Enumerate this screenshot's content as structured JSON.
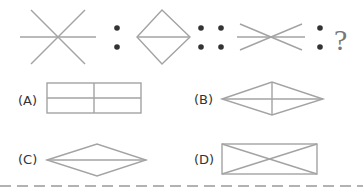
{
  "question": {
    "analogy": {
      "figure_1": "asterisk-three-lines",
      "separator_1": ":",
      "figure_2": "diamond-with-horizontal-line",
      "separator_2": "::",
      "figure_3": "flattened-asterisk-three-lines",
      "separator_3": ":",
      "unknown": "?"
    },
    "options": [
      {
        "label": "(A)",
        "figure": "rectangle-divided-into-four"
      },
      {
        "label": "(B)",
        "figure": "rhombus-with-both-diagonals"
      },
      {
        "label": "(C)",
        "figure": "flat-rhombus-with-horizontal-diagonal"
      },
      {
        "label": "(D)",
        "figure": "rectangle-with-both-diagonals"
      }
    ]
  },
  "colors": {
    "line": "#a3a3a3",
    "dot": "#333333",
    "text": "#333333",
    "divider": "#999999"
  }
}
